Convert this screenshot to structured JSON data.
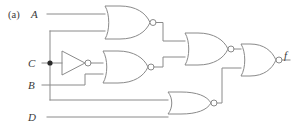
{
  "figure": {
    "caption_label": "(a)"
  },
  "colors": {
    "wire": "#8a8a8a",
    "gate_outline": "#8a8a8a",
    "bubble_fill": "#ffffff",
    "junction": "#2a2a2a",
    "label_text": "#3a3a3a",
    "background": "#ffffff"
  },
  "inputs": [
    {
      "id": "A",
      "label": "A",
      "y": 14
    },
    {
      "id": "C",
      "label": "C",
      "y": 63
    },
    {
      "id": "B",
      "label": "B",
      "y": 85
    },
    {
      "id": "D",
      "label": "D",
      "y": 117
    }
  ],
  "outputs": [
    {
      "id": "f",
      "label": "f",
      "y": 60
    }
  ],
  "gates": [
    {
      "id": "g1",
      "type": "NOR",
      "name": "nor-gate-1",
      "inputs": [
        "A",
        "C"
      ],
      "output_y": 23
    },
    {
      "id": "inv",
      "type": "NOT",
      "name": "inverter-c",
      "inputs": [
        "C"
      ],
      "output_y": 63
    },
    {
      "id": "g2",
      "type": "NOR",
      "name": "nor-gate-2",
      "inputs": [
        "inv",
        "B"
      ],
      "output_y": 67
    },
    {
      "id": "g3",
      "type": "NOR",
      "name": "nor-gate-3",
      "inputs": [
        "g1",
        "g2"
      ],
      "output_y": 49
    },
    {
      "id": "g4",
      "type": "NOR",
      "name": "nor-gate-4",
      "inputs": [
        "C",
        "D"
      ],
      "output_y": 103
    },
    {
      "id": "g5",
      "type": "NOR",
      "name": "nor-gate-5-output",
      "inputs": [
        "g3",
        "g4"
      ],
      "output_y": 60
    }
  ],
  "junctions": [
    {
      "id": "c-tap",
      "name": "junction-dot-c",
      "x": 50,
      "y": 63
    }
  ]
}
